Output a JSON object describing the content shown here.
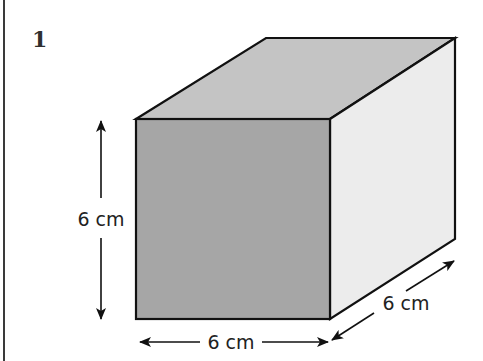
{
  "question": {
    "number": "1"
  },
  "figure": {
    "shape": "cube",
    "dimensions": {
      "height_label": "6 cm",
      "width_label": "6 cm",
      "depth_label": "6 cm"
    },
    "colors": {
      "front_face": "#a6a6a6",
      "top_face": "#c4c4c4",
      "right_face": "#ececec",
      "edge": "#111111"
    }
  }
}
